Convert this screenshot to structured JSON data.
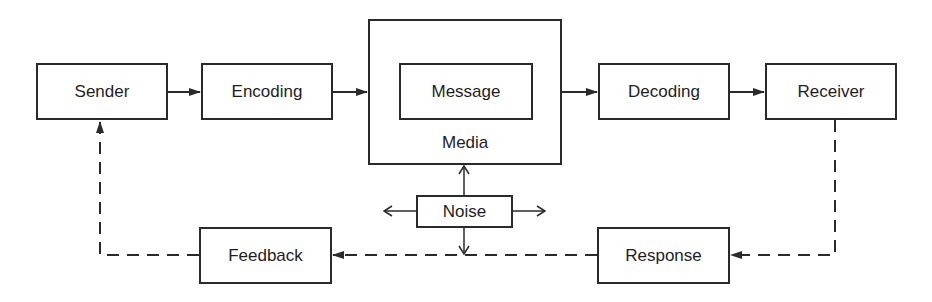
{
  "diagram": {
    "nodes": {
      "sender": "Sender",
      "encoding": "Encoding",
      "media": "Media",
      "message": "Message",
      "decoding": "Decoding",
      "receiver": "Receiver",
      "noise": "Noise",
      "feedback": "Feedback",
      "response": "Response"
    },
    "edges": [
      {
        "from": "Sender",
        "to": "Encoding",
        "style": "solid"
      },
      {
        "from": "Encoding",
        "to": "Media",
        "style": "solid"
      },
      {
        "from": "Media",
        "to": "Decoding",
        "style": "solid"
      },
      {
        "from": "Decoding",
        "to": "Receiver",
        "style": "solid"
      },
      {
        "from": "Receiver",
        "to": "Response",
        "style": "dashed"
      },
      {
        "from": "Response",
        "to": "Feedback",
        "style": "dashed"
      },
      {
        "from": "Feedback",
        "to": "Sender",
        "style": "dashed"
      },
      {
        "from": "Noise",
        "to": "Media",
        "style": "solid-open"
      },
      {
        "from": "Noise",
        "to": "left",
        "style": "solid-open"
      },
      {
        "from": "Noise",
        "to": "right",
        "style": "solid-open"
      },
      {
        "from": "Noise",
        "to": "feedback-line",
        "style": "solid-open"
      }
    ],
    "colors": {
      "stroke": "#2a2a2a",
      "text": "#1e1e1e",
      "background": "#ffffff"
    }
  }
}
